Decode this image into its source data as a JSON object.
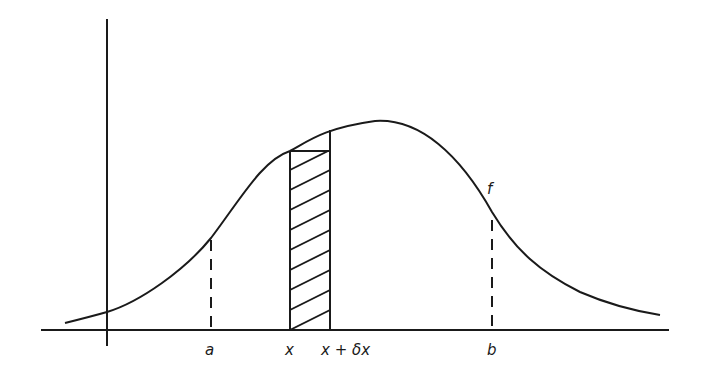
{
  "diagram": {
    "curve_label": "f",
    "axis_labels": {
      "a": "a",
      "x": "x",
      "x_plus_dx": "x + δx",
      "b": "b"
    },
    "colors": {
      "stroke": "#1a1a1a",
      "background": "#ffffff"
    }
  }
}
